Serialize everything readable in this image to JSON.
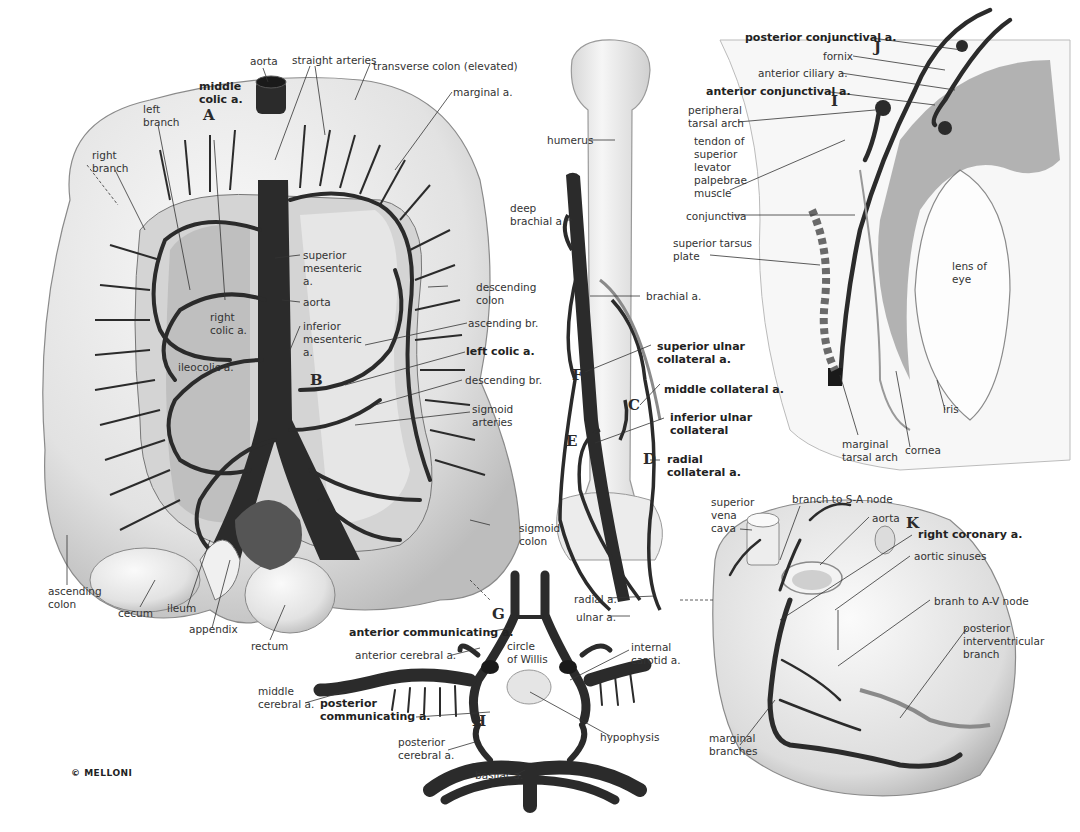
{
  "copyright": "© MELLONI",
  "colors": {
    "artery": "#2b2b2b",
    "organ_fill": "#e9e9e9",
    "organ_shade": "#c9c9c9",
    "leader_line": "#333333",
    "background": "#ffffff"
  },
  "panels": {
    "colon": {
      "letters": {
        "A": "A",
        "B": "B"
      },
      "labels": {
        "aorta_top": "aorta",
        "straight_arteries": "straight arteries",
        "transverse_colon": "transverse colon (elevated)",
        "middle_colic": "middle\ncolic a.",
        "left_branch": "left\nbranch",
        "right_branch": "right\nbranch",
        "marginal": "marginal a.",
        "superior_mesenteric": "superior\nmesenteric\na.",
        "aorta_mid": "aorta",
        "inferior_mesenteric": "inferior\nmesenteric\na.",
        "right_colic": "right\ncolic a.",
        "ileocolic": "ileocolic a.",
        "descending_colon": "descending\ncolon",
        "ascending_br": "ascending br.",
        "left_colic": "left colic a.",
        "descending_br": "descending br.",
        "sigmoid_arteries": "sigmoid\narteries",
        "sigmoid_colon": "sigmoid\ncolon",
        "ascending_colon": "ascending\ncolon",
        "cecum": "cecum",
        "ileum": "ileum",
        "appendix": "appendix",
        "rectum": "rectum"
      }
    },
    "arm": {
      "letters": {
        "C": "C",
        "D": "D",
        "E": "E",
        "F": "F"
      },
      "labels": {
        "humerus": "humerus",
        "deep_brachial": "deep\nbrachial a.",
        "brachial": "brachial a.",
        "superior_ulnar": "superior ulnar\ncollateral a.",
        "middle_collateral": "middle collateral a.",
        "inferior_ulnar": "inferior ulnar\ncollateral",
        "radial_collateral": "radial\ncollateral a.",
        "radial": "radial a.",
        "ulnar": "ulnar a."
      }
    },
    "eye": {
      "letters": {
        "I": "I",
        "J": "J"
      },
      "labels": {
        "posterior_conjunctival": "posterior conjunctival a.",
        "fornix": "fornix",
        "anterior_ciliary": "anterior ciliary a.",
        "anterior_conjunctival": "anterior conjunctival a.",
        "peripheral_tarsal": "peripheral\ntarsal arch",
        "tendon": "tendon of\nsuperior\nlevator\npalpebrae\nmuscle",
        "conjunctiva": "conjunctiva",
        "superior_tarsus": "superior tarsus\nplate",
        "lens": "lens of\neye",
        "iris": "iris",
        "marginal_tarsal": "marginal\ntarsal arch",
        "cornea": "cornea"
      }
    },
    "brain": {
      "letters": {
        "G": "G",
        "H": "H"
      },
      "labels": {
        "anterior_communicating": "anterior communicating a.",
        "circle_of_willis": "circle\nof Willis",
        "anterior_cerebral": "anterior cerebral a.",
        "internal_carotid": "internal\ncarotid a.",
        "middle_cerebral": "middle\ncerebral a.",
        "posterior_communicating": "posterior\ncommunicating a.",
        "hypophysis": "hypophysis",
        "posterior_cerebral": "posterior\ncerebral a.",
        "basilar": "basilar a."
      }
    },
    "heart": {
      "letters": {
        "K": "K"
      },
      "labels": {
        "superior_vena_cava": "superior\nvena\ncava",
        "branch_sa": "branch to S-A node",
        "aorta": "aorta",
        "right_coronary": "right coronary a.",
        "aortic_sinuses": "aortic sinuses",
        "branch_av": "branh to A-V node",
        "posterior_interventricular": "posterior\ninterventricular\nbranch",
        "marginal_branches": "marginal\nbranches"
      }
    }
  }
}
